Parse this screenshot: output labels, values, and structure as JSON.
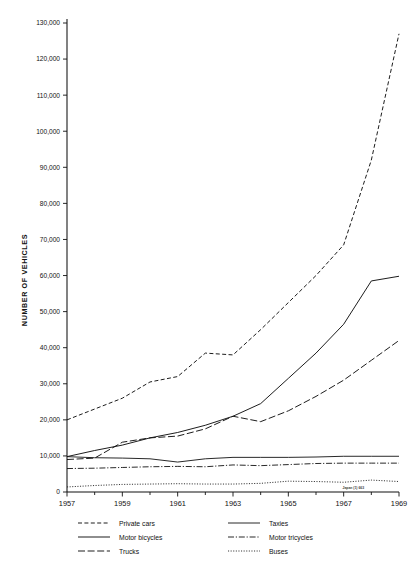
{
  "chart_data": {
    "type": "line",
    "title": "",
    "xlabel": "",
    "ylabel": "NUMBER OF VEHICLES",
    "xlim": [
      1957,
      1969
    ],
    "ylim": [
      0,
      130000
    ],
    "grid": false,
    "legend_position": "bottom",
    "x": [
      1957,
      1958,
      1959,
      1960,
      1961,
      1962,
      1963,
      1964,
      1965,
      1966,
      1967,
      1968,
      1969
    ],
    "x_tick_labels": [
      "1957",
      "1959",
      "1961",
      "1963",
      "1965",
      "1967",
      "1969"
    ],
    "x_ticks": [
      1957,
      1959,
      1961,
      1963,
      1965,
      1967,
      1969
    ],
    "x_minor_ticks": [
      1958,
      1960,
      1962,
      1964,
      1966,
      1968
    ],
    "y_ticks": [
      0,
      10000,
      20000,
      30000,
      40000,
      50000,
      60000,
      70000,
      80000,
      90000,
      100000,
      110000,
      120000,
      130000
    ],
    "y_tick_labels": [
      "0",
      "10,000",
      "20,000",
      "30,000",
      "40,000",
      "50,000",
      "60,000",
      "70,000",
      "80,000",
      "90,000",
      "100,000",
      "110,000",
      "120,000",
      "130,000"
    ],
    "series": [
      {
        "name": "Private cars",
        "style": "dashed",
        "dasharray": "4,2.4",
        "width": 0.95,
        "values": [
          20000,
          23000,
          26000,
          30500,
          32000,
          38500,
          38000,
          45000,
          52500,
          60000,
          68500,
          92000,
          127000
        ]
      },
      {
        "name": "Motor bicycles",
        "style": "solid",
        "dasharray": "none",
        "width": 0.95,
        "values": [
          9800,
          11500,
          13000,
          15000,
          16500,
          18500,
          21000,
          24500,
          31500,
          38500,
          46500,
          58500,
          59800
        ]
      },
      {
        "name": "Trucks",
        "style": "long-dash",
        "dasharray": "7,2.6",
        "width": 0.95,
        "values": [
          9000,
          9400,
          13800,
          15000,
          15500,
          17500,
          21000,
          19500,
          22500,
          26500,
          31000,
          36500,
          42000
        ]
      },
      {
        "name": "Taxies",
        "style": "solid",
        "dasharray": "none",
        "width": 0.9,
        "values": [
          9800,
          9500,
          9400,
          9200,
          8300,
          9200,
          9600,
          9600,
          9600,
          9700,
          9900,
          9900,
          9900
        ]
      },
      {
        "name": "Motor tricycles",
        "style": "dash-dot",
        "dasharray": "6,1.8,1.2,1.8",
        "width": 0.9,
        "values": [
          6500,
          6600,
          6800,
          7000,
          7100,
          7000,
          7500,
          7300,
          7600,
          7900,
          8000,
          8000,
          8000
        ]
      },
      {
        "name": "Buses",
        "style": "dotted",
        "dasharray": "1.1,1.5",
        "width": 0.85,
        "values": [
          1400,
          1800,
          2100,
          2200,
          2300,
          2200,
          2200,
          2400,
          3000,
          2900,
          2700,
          3300,
          2900
        ]
      }
    ],
    "annotations": [
      {
        "text": "Japan (1) 663",
        "x": 1967.35,
        "y": 0,
        "note": "illegible scan artifact on axis near 1967"
      }
    ]
  },
  "legend": {
    "columns": [
      [
        {
          "label": "Private cars",
          "style": "dashed"
        },
        {
          "label": "Motor bicycles",
          "style": "solid"
        },
        {
          "label": "Trucks",
          "style": "long-dash"
        }
      ],
      [
        {
          "label": "Taxies",
          "style": "solid"
        },
        {
          "label": "Motor tricycles",
          "style": "dash-dot"
        },
        {
          "label": "Buses",
          "style": "dotted"
        }
      ]
    ]
  },
  "colors": {
    "ink": "#111111",
    "background": "#ffffff"
  }
}
